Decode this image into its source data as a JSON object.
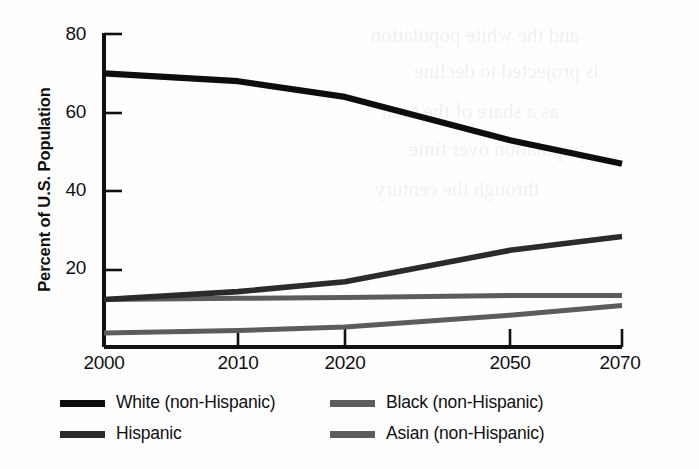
{
  "chart_data": {
    "type": "line",
    "title": "",
    "xlabel": "",
    "ylabel": "Percent of U.S. Population",
    "categories": [
      "2000",
      "2010",
      "2020",
      "2050",
      "2070"
    ],
    "x_tick_labels": [
      "2000",
      "2010",
      "2020",
      "2050",
      "2070"
    ],
    "y_tick_labels": [
      "20",
      "40",
      "60",
      "80"
    ],
    "y_ticks": [
      20,
      40,
      60,
      80
    ],
    "ylim": [
      0,
      84
    ],
    "grid": false,
    "legend_position": "bottom",
    "series": [
      {
        "name": "White (non-Hispanic)",
        "color": "#0d0d0d",
        "values": [
          70,
          68,
          64,
          53,
          47
        ]
      },
      {
        "name": "Hispanic",
        "color": "#2b2b2b",
        "values": [
          12.5,
          14.5,
          17,
          25,
          28.5
        ]
      },
      {
        "name": "Black (non-Hispanic)",
        "color": "#5c5c5c",
        "values": [
          12.5,
          12.8,
          13,
          13.5,
          13.5
        ]
      },
      {
        "name": "Asian (non-Hispanic)",
        "color": "#5c5c5c",
        "values": [
          4,
          4.6,
          5.5,
          8.5,
          11
        ]
      }
    ]
  },
  "legend": {
    "items": [
      {
        "label": "White (non-Hispanic)",
        "color": "#0d0d0d"
      },
      {
        "label": "Hispanic",
        "color": "#2b2b2b"
      },
      {
        "label": "Black (non-Hispanic)",
        "color": "#5c5c5c"
      },
      {
        "label": "Asian (non-Hispanic)",
        "color": "#5c5c5c"
      }
    ]
  },
  "axis": {
    "color": "#111111"
  }
}
